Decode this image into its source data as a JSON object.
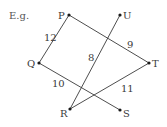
{
  "caption": "E.g.",
  "nodes": {
    "P": {
      "label": "P",
      "x": 69,
      "y": 15
    },
    "U": {
      "label": "U",
      "x": 120,
      "y": 15
    },
    "Q": {
      "label": "Q",
      "x": 39,
      "y": 63
    },
    "T": {
      "label": "T",
      "x": 149,
      "y": 63
    },
    "R": {
      "label": "R",
      "x": 70,
      "y": 109
    },
    "S": {
      "label": "S",
      "x": 120,
      "y": 110
    }
  },
  "edges": [
    {
      "from": "P",
      "to": "Q",
      "weight": "12"
    },
    {
      "from": "P",
      "to": "T",
      "weight": "9"
    },
    {
      "from": "U",
      "to": "R",
      "weight": "8"
    },
    {
      "from": "Q",
      "to": "S",
      "weight": "10"
    },
    {
      "from": "R",
      "to": "T",
      "weight": "11"
    }
  ]
}
